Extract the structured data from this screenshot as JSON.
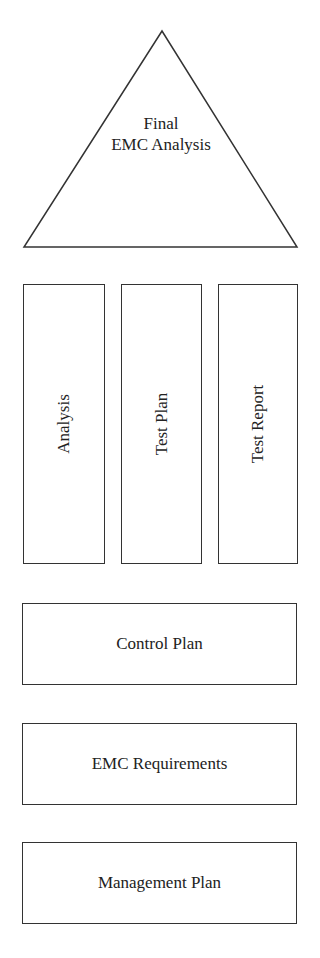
{
  "roof": {
    "line1": "Final",
    "line2": "EMC Analysis"
  },
  "pillars": [
    {
      "label": "Analysis"
    },
    {
      "label": "Test Plan"
    },
    {
      "label": "Test Report"
    }
  ],
  "foundation": [
    {
      "label": "Control Plan"
    },
    {
      "label": "EMC Requirements"
    },
    {
      "label": "Management Plan"
    }
  ],
  "colors": {
    "stroke": "#333333",
    "background": "#ffffff",
    "text": "#222222"
  }
}
